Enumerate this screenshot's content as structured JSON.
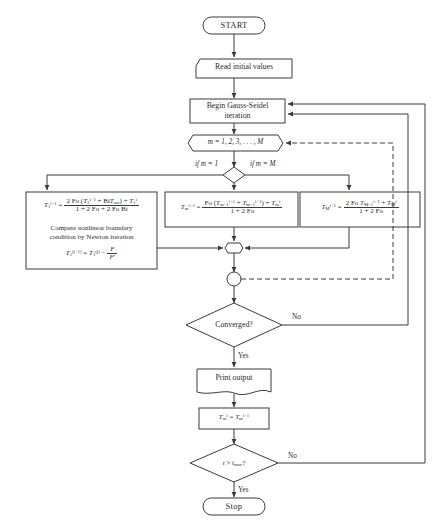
{
  "diagram": {
    "stroke_color": "#3a3a3a",
    "background_color": "#ffffff"
  },
  "nodes": {
    "start": {
      "label": "START",
      "shape": "terminator"
    },
    "read": {
      "label": "Read initial values",
      "shape": "input"
    },
    "begin_iteration": {
      "line1": "Begin  Gauss-Seidel",
      "line2": "iteration",
      "shape": "process"
    },
    "loop": {
      "label": "m = 1, 2, 3, . . . , M",
      "shape": "hexagon"
    },
    "branch": {
      "shape": "diamond",
      "label_left": "if m = 1",
      "label_right": "if m = M"
    },
    "box_left": {
      "formula_lhs": "T",
      "formula_lhs_sup": "i+1",
      "formula_lhs_sub": "1",
      "num": "2 Fo (T₂ⁱ⁺¹ + Bi T𝑠𝑢𝑟) + T₁ⁱ",
      "den": "1 + 2 Fo + 2 Fo Bi",
      "text_line1": "Compute nonlinear boundary",
      "text_line2": "condition by Newton iteration",
      "newton": "T₁⁽ʲ⁺¹⁾ = T₁⁽ʲ⁾ − F / F′"
    },
    "box_mid": {
      "num": "Fo (Tₘ₊₁ⁱ⁺¹ + Tₘ₋₁ⁱ⁺¹) + Tₘⁱ",
      "den": "1 + 2 Fo"
    },
    "box_right": {
      "num": "2 Fo T𝑀₋₁ⁱ⁺¹ + T𝑀ⁱ",
      "den": "1 + 2 Fo"
    },
    "merge_junction": {
      "shape": "small-hexagon"
    },
    "connector_circle": {
      "shape": "circle"
    },
    "converged": {
      "label": "Converged?",
      "shape": "diamond",
      "yes": "Yes",
      "no": "No"
    },
    "print": {
      "label": "Print output",
      "shape": "document"
    },
    "assign": {
      "label": "Tₘⁱ = Tₘⁱ⁺¹",
      "shape": "process"
    },
    "time_check": {
      "label": "t > t max ?",
      "shape": "diamond",
      "yes": "Yes",
      "no": "No"
    },
    "stop": {
      "label": "Stop",
      "shape": "terminator"
    }
  },
  "edge_labels": {
    "if_m_1": "if m = 1",
    "if_m_M": "if m = M",
    "converged_no": "No",
    "converged_yes": "Yes",
    "time_no": "No",
    "time_yes": "Yes"
  }
}
